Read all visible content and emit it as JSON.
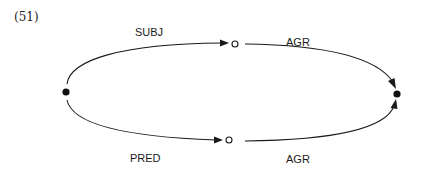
{
  "example_number": "(51)",
  "nodes": [
    {
      "id": "root",
      "kind": "filled"
    },
    {
      "id": "subj-node",
      "kind": "hollow"
    },
    {
      "id": "pred-node",
      "kind": "hollow"
    },
    {
      "id": "target",
      "kind": "filled"
    }
  ],
  "edges": [
    {
      "id": "subj",
      "from": "root",
      "to": "subj-node",
      "label": "SUBJ"
    },
    {
      "id": "agr-top",
      "from": "subj-node",
      "to": "target",
      "label": "AGR"
    },
    {
      "id": "pred",
      "from": "root",
      "to": "pred-node",
      "label": "PRED"
    },
    {
      "id": "agr-bottom",
      "from": "pred-node",
      "to": "target",
      "label": "AGR"
    }
  ],
  "colors": {
    "ink": "#1a1a1a",
    "background": "#ffffff"
  }
}
